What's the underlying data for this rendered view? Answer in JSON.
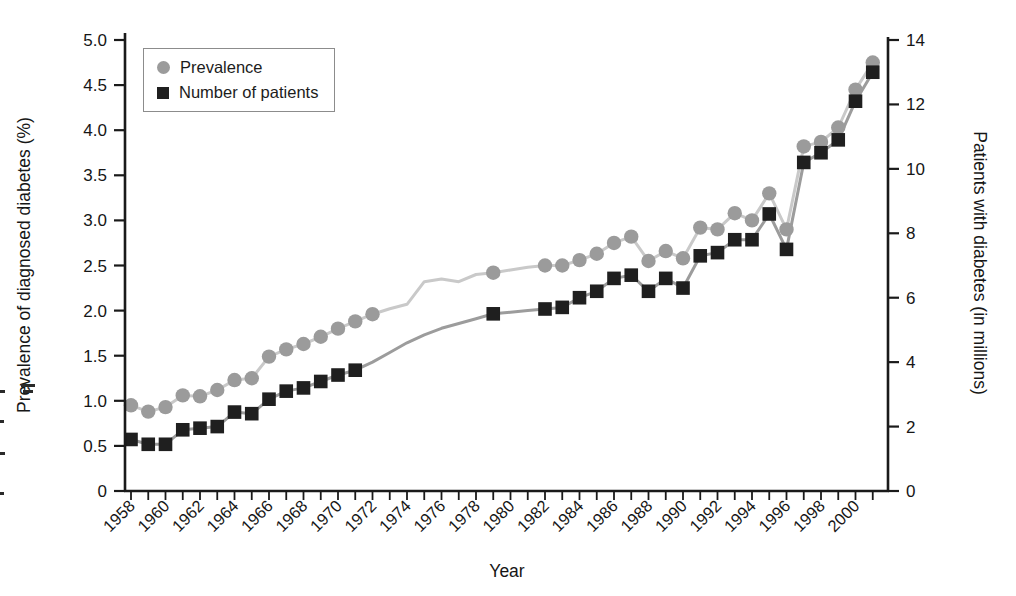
{
  "figure": {
    "background_color": "#ffffff",
    "axis_color": "#1a1a1a",
    "xlabel": "Year"
  },
  "chart_data": {
    "type": "line",
    "title": "",
    "xlabel": "Year",
    "ylabel_left": "Prevalence of diagnosed diabetes (%)",
    "ylabel_right": "Patients with diabetes (in millions)",
    "x_range": [
      1958,
      2001
    ],
    "x_tick_years_labeled": [
      1958,
      1960,
      1962,
      1964,
      1966,
      1968,
      1970,
      1972,
      1974,
      1976,
      1978,
      1980,
      1982,
      1984,
      1986,
      1988,
      1990,
      1992,
      1994,
      1996,
      1998,
      2000
    ],
    "x_minor_tick_years": [
      1958,
      1959,
      1960,
      1961,
      1962,
      1963,
      1964,
      1965,
      1966,
      1967,
      1968,
      1969,
      1970,
      1971,
      1972,
      1973,
      1974,
      1975,
      1976,
      1977,
      1978,
      1979,
      1980,
      1981,
      1982,
      1983,
      1984,
      1985,
      1986,
      1987,
      1988,
      1989,
      1990,
      1991,
      1992,
      1993,
      1994,
      1995,
      1996,
      1997,
      1998,
      1999,
      2000,
      2001
    ],
    "ylim_left": [
      0,
      5.0
    ],
    "yticks_left": [
      {
        "value": 0.0,
        "label": "0"
      },
      {
        "value": 0.5,
        "label": "0.5"
      },
      {
        "value": 1.0,
        "label": "1.0"
      },
      {
        "value": 1.5,
        "label": "1.5"
      },
      {
        "value": 2.0,
        "label": "2.0"
      },
      {
        "value": 2.5,
        "label": "2.5"
      },
      {
        "value": 3.0,
        "label": "3.0"
      },
      {
        "value": 3.5,
        "label": "3.5"
      },
      {
        "value": 4.0,
        "label": "4.0"
      },
      {
        "value": 4.5,
        "label": "4.5"
      },
      {
        "value": 5.0,
        "label": "5.0"
      }
    ],
    "ylim_right": [
      0,
      14
    ],
    "yticks_right": [
      {
        "value": 0,
        "label": "0"
      },
      {
        "value": 2,
        "label": "2"
      },
      {
        "value": 4,
        "label": "4"
      },
      {
        "value": 6,
        "label": "6"
      },
      {
        "value": 8,
        "label": "8"
      },
      {
        "value": 10,
        "label": "10"
      },
      {
        "value": 12,
        "label": "12"
      },
      {
        "value": 14,
        "label": "14"
      }
    ],
    "legend": {
      "position": "top-left",
      "items": [
        {
          "label": "Prevalence",
          "marker": "circle",
          "color": "#9b9b9b"
        },
        {
          "label": "Number of patients",
          "marker": "square",
          "color": "#1f1f1f"
        }
      ]
    },
    "series": [
      {
        "name": "Prevalence",
        "axis": "left",
        "marker": "circle",
        "marker_color": "#9b9b9b",
        "line_color": "#c9c9c9",
        "points": [
          {
            "year": 1958,
            "value": 0.95,
            "marker": true
          },
          {
            "year": 1959,
            "value": 0.88,
            "marker": true
          },
          {
            "year": 1960,
            "value": 0.93,
            "marker": true
          },
          {
            "year": 1961,
            "value": 1.06,
            "marker": true
          },
          {
            "year": 1962,
            "value": 1.05,
            "marker": true
          },
          {
            "year": 1963,
            "value": 1.12,
            "marker": true
          },
          {
            "year": 1964,
            "value": 1.23,
            "marker": true
          },
          {
            "year": 1965,
            "value": 1.25,
            "marker": true
          },
          {
            "year": 1966,
            "value": 1.49,
            "marker": true
          },
          {
            "year": 1967,
            "value": 1.57,
            "marker": true
          },
          {
            "year": 1968,
            "value": 1.63,
            "marker": true
          },
          {
            "year": 1969,
            "value": 1.71,
            "marker": true
          },
          {
            "year": 1970,
            "value": 1.8,
            "marker": true
          },
          {
            "year": 1971,
            "value": 1.88,
            "marker": true
          },
          {
            "year": 1972,
            "value": 1.96,
            "marker": true
          },
          {
            "year": 1973,
            "value": 2.02,
            "marker": false
          },
          {
            "year": 1974,
            "value": 2.07,
            "marker": false
          },
          {
            "year": 1975,
            "value": 2.32,
            "marker": false
          },
          {
            "year": 1976,
            "value": 2.35,
            "marker": false
          },
          {
            "year": 1977,
            "value": 2.32,
            "marker": false
          },
          {
            "year": 1978,
            "value": 2.4,
            "marker": false
          },
          {
            "year": 1979,
            "value": 2.42,
            "marker": true
          },
          {
            "year": 1980,
            "value": 2.45,
            "marker": false
          },
          {
            "year": 1981,
            "value": 2.48,
            "marker": false
          },
          {
            "year": 1982,
            "value": 2.5,
            "marker": true
          },
          {
            "year": 1983,
            "value": 2.5,
            "marker": true
          },
          {
            "year": 1984,
            "value": 2.56,
            "marker": true
          },
          {
            "year": 1985,
            "value": 2.63,
            "marker": true
          },
          {
            "year": 1986,
            "value": 2.75,
            "marker": true
          },
          {
            "year": 1987,
            "value": 2.82,
            "marker": true
          },
          {
            "year": 1988,
            "value": 2.55,
            "marker": true
          },
          {
            "year": 1989,
            "value": 2.66,
            "marker": true
          },
          {
            "year": 1990,
            "value": 2.58,
            "marker": true
          },
          {
            "year": 1991,
            "value": 2.92,
            "marker": true
          },
          {
            "year": 1992,
            "value": 2.9,
            "marker": true
          },
          {
            "year": 1993,
            "value": 3.08,
            "marker": true
          },
          {
            "year": 1994,
            "value": 3.0,
            "marker": true
          },
          {
            "year": 1995,
            "value": 3.3,
            "marker": true
          },
          {
            "year": 1996,
            "value": 2.9,
            "marker": true
          },
          {
            "year": 1997,
            "value": 3.82,
            "marker": true
          },
          {
            "year": 1998,
            "value": 3.87,
            "marker": true
          },
          {
            "year": 1999,
            "value": 4.03,
            "marker": true
          },
          {
            "year": 2000,
            "value": 4.45,
            "marker": true
          },
          {
            "year": 2001,
            "value": 4.75,
            "marker": true
          }
        ]
      },
      {
        "name": "Number of patients",
        "axis": "right",
        "marker": "square",
        "marker_color": "#1f1f1f",
        "line_color": "#9c9c9c",
        "points": [
          {
            "year": 1958,
            "value": 1.6,
            "marker": true
          },
          {
            "year": 1959,
            "value": 1.45,
            "marker": true
          },
          {
            "year": 1960,
            "value": 1.45,
            "marker": true
          },
          {
            "year": 1961,
            "value": 1.9,
            "marker": true
          },
          {
            "year": 1962,
            "value": 1.95,
            "marker": true
          },
          {
            "year": 1963,
            "value": 2.0,
            "marker": true
          },
          {
            "year": 1964,
            "value": 2.45,
            "marker": true
          },
          {
            "year": 1965,
            "value": 2.4,
            "marker": true
          },
          {
            "year": 1966,
            "value": 2.85,
            "marker": true
          },
          {
            "year": 1967,
            "value": 3.1,
            "marker": true
          },
          {
            "year": 1968,
            "value": 3.2,
            "marker": true
          },
          {
            "year": 1969,
            "value": 3.4,
            "marker": true
          },
          {
            "year": 1970,
            "value": 3.6,
            "marker": true
          },
          {
            "year": 1971,
            "value": 3.75,
            "marker": true
          },
          {
            "year": 1972,
            "value": 4.0,
            "marker": false
          },
          {
            "year": 1973,
            "value": 4.3,
            "marker": false
          },
          {
            "year": 1974,
            "value": 4.6,
            "marker": false
          },
          {
            "year": 1975,
            "value": 4.85,
            "marker": false
          },
          {
            "year": 1976,
            "value": 5.05,
            "marker": false
          },
          {
            "year": 1977,
            "value": 5.2,
            "marker": false
          },
          {
            "year": 1978,
            "value": 5.35,
            "marker": false
          },
          {
            "year": 1979,
            "value": 5.5,
            "marker": true
          },
          {
            "year": 1980,
            "value": 5.55,
            "marker": false
          },
          {
            "year": 1981,
            "value": 5.6,
            "marker": false
          },
          {
            "year": 1982,
            "value": 5.65,
            "marker": true
          },
          {
            "year": 1983,
            "value": 5.7,
            "marker": true
          },
          {
            "year": 1984,
            "value": 6.0,
            "marker": true
          },
          {
            "year": 1985,
            "value": 6.2,
            "marker": true
          },
          {
            "year": 1986,
            "value": 6.6,
            "marker": true
          },
          {
            "year": 1987,
            "value": 6.7,
            "marker": true
          },
          {
            "year": 1988,
            "value": 6.2,
            "marker": true
          },
          {
            "year": 1989,
            "value": 6.6,
            "marker": true
          },
          {
            "year": 1990,
            "value": 6.3,
            "marker": true
          },
          {
            "year": 1991,
            "value": 7.3,
            "marker": true
          },
          {
            "year": 1992,
            "value": 7.4,
            "marker": true
          },
          {
            "year": 1993,
            "value": 7.8,
            "marker": true
          },
          {
            "year": 1994,
            "value": 7.8,
            "marker": true
          },
          {
            "year": 1995,
            "value": 8.6,
            "marker": true
          },
          {
            "year": 1996,
            "value": 7.5,
            "marker": true
          },
          {
            "year": 1997,
            "value": 10.2,
            "marker": true
          },
          {
            "year": 1998,
            "value": 10.5,
            "marker": true
          },
          {
            "year": 1999,
            "value": 10.9,
            "marker": true
          },
          {
            "year": 2000,
            "value": 12.1,
            "marker": true
          },
          {
            "year": 2001,
            "value": 13.0,
            "marker": true
          }
        ]
      }
    ]
  }
}
